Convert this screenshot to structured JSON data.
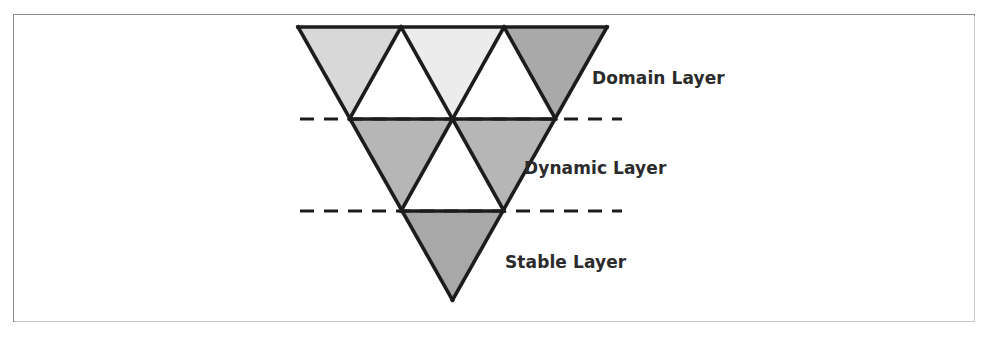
{
  "figure": {
    "kind": "inverted-triangle-layer-diagram",
    "background_color": "#ffffff",
    "border_color": "#8d8d8d",
    "outline_color": "#1c1c1c",
    "dash_color": "#1c1c1c",
    "text_color": "#2b2b2b"
  },
  "labels": {
    "domain": "Domain Layer",
    "dynamic": "Dynamic Layer",
    "stable": "Stable Layer"
  },
  "geometry": {
    "apex_x": 452,
    "apex_y": 300,
    "top_y": 27,
    "left_x": 298,
    "right_x": 607,
    "row_height": 91,
    "half_width": 154.5
  },
  "divider_lines": [
    {
      "name": "domain-dynamic-divider",
      "y": 119,
      "x_start": 300,
      "x_end": 622
    },
    {
      "name": "dynamic-stable-divider",
      "y": 211,
      "x_start": 300,
      "x_end": 622
    }
  ],
  "triangles": [
    {
      "name": "domain-down-left",
      "row": 1,
      "orientation": "down",
      "fill": "#d8d8d8"
    },
    {
      "name": "domain-up-left",
      "row": 1,
      "orientation": "up",
      "fill": "#ffffff"
    },
    {
      "name": "domain-down-center",
      "row": 1,
      "orientation": "down",
      "fill": "#ececec"
    },
    {
      "name": "domain-up-right",
      "row": 1,
      "orientation": "up",
      "fill": "#ffffff"
    },
    {
      "name": "domain-down-right",
      "row": 1,
      "orientation": "down",
      "fill": "#a9a9a9"
    },
    {
      "name": "dynamic-down-left",
      "row": 2,
      "orientation": "down",
      "fill": "#b6b6b6"
    },
    {
      "name": "dynamic-up-center",
      "row": 2,
      "orientation": "up",
      "fill": "#ffffff"
    },
    {
      "name": "dynamic-down-right",
      "row": 2,
      "orientation": "down",
      "fill": "#b6b6b6"
    },
    {
      "name": "stable-down-center",
      "row": 3,
      "orientation": "down",
      "fill": "#a8a8a8"
    }
  ]
}
